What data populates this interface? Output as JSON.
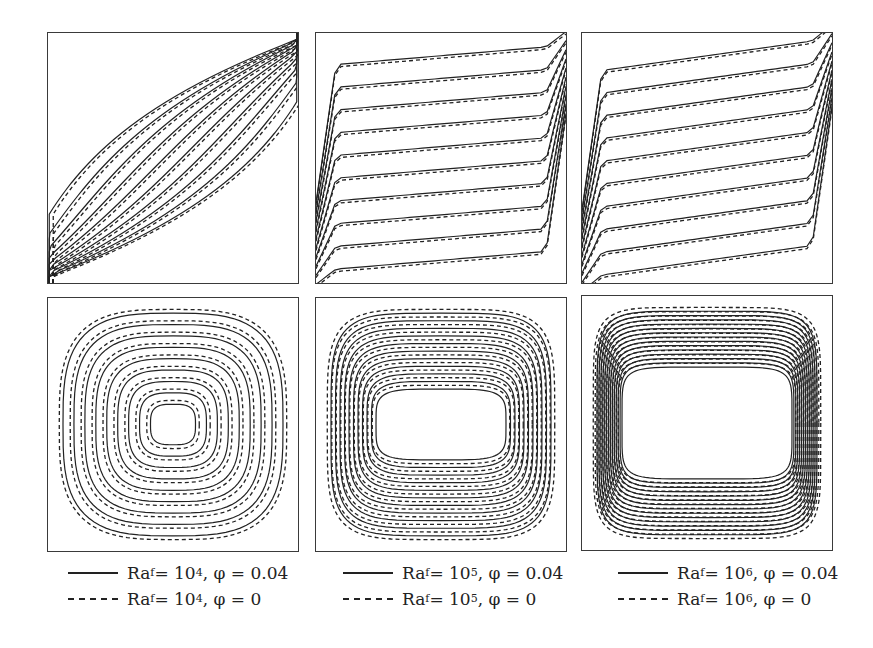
{
  "chart_data": {
    "type": "contour",
    "title": "",
    "layout": {
      "rows": 2,
      "cols": 3,
      "row_labels": [
        "isotherms",
        "streamlines"
      ]
    },
    "columns": [
      {
        "Ra_exp": "4",
        "legend": [
          {
            "style": "solid",
            "label_pre": "Ra",
            "sub": "f",
            "mid": " = 10",
            "sup": "4",
            "post": ", φ = 0.04"
          },
          {
            "style": "dashed",
            "label_pre": "Ra",
            "sub": "f",
            "mid": " = 10",
            "sup": "4",
            "post": ", φ = 0"
          }
        ]
      },
      {
        "Ra_exp": "5",
        "legend": [
          {
            "style": "solid",
            "label_pre": "Ra",
            "sub": "f",
            "mid": " = 10",
            "sup": "5",
            "post": ", φ = 0.04"
          },
          {
            "style": "dashed",
            "label_pre": "Ra",
            "sub": "f",
            "mid": " = 10",
            "sup": "5",
            "post": ", φ = 0"
          }
        ]
      },
      {
        "Ra_exp": "6",
        "legend": [
          {
            "style": "solid",
            "label_pre": "Ra",
            "sub": "f",
            "mid": " = 10",
            "sup": "6",
            "post": ", φ = 0.04"
          },
          {
            "style": "dashed",
            "label_pre": "Ra",
            "sub": "f",
            "mid": " = 10",
            "sup": "6",
            "post": ", φ = 0"
          }
        ]
      }
    ],
    "series": [
      {
        "name": "φ = 0.04",
        "line": "solid"
      },
      {
        "name": "φ = 0",
        "line": "dashed"
      }
    ],
    "colors": {
      "line": "#222222",
      "frame": "#3a3a3a"
    }
  }
}
